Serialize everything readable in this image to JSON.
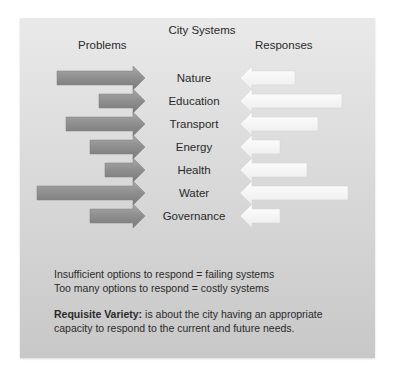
{
  "title": "City Systems",
  "columns": {
    "left": "Problems",
    "right": "Responses"
  },
  "colors": {
    "problem_arrow": "#8c8c8c",
    "problem_arrow_light": "#a6a6a6",
    "response_arrow": "#f7f7f7",
    "panel_top": "#e9e9e9",
    "panel_bottom": "#c8c8c8",
    "text": "#2a2a2a"
  },
  "systems": [
    {
      "name": "Nature",
      "problem_start": 57,
      "response_end": 295
    },
    {
      "name": "Education",
      "problem_start": 99,
      "response_end": 342
    },
    {
      "name": "Transport",
      "problem_start": 66,
      "response_end": 318
    },
    {
      "name": "Energy",
      "problem_start": 90,
      "response_end": 280
    },
    {
      "name": "Health",
      "problem_start": 105,
      "response_end": 307
    },
    {
      "name": "Water",
      "problem_start": 37,
      "response_end": 348
    },
    {
      "name": "Governance",
      "problem_start": 90,
      "response_end": 280
    }
  ],
  "notes": {
    "line1": "Insufficient options to respond = failing systems",
    "line2": "Too many options to respond = costly systems",
    "definition_term": "Requisite Variety:",
    "definition_line1_rest": " is about the city having an appropriate",
    "definition_line2": "capacity to respond to the current and future needs."
  }
}
